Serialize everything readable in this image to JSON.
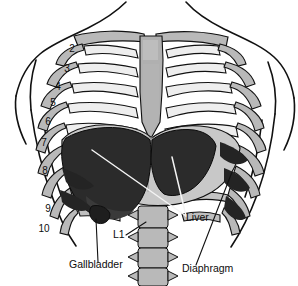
{
  "figure": {
    "background_color": "#ffffff",
    "outline_color": "#111111",
    "bone_fill": "#b9b9b9",
    "bone_highlight": "#f2f2f2",
    "organ_dark": "#2b2b2b",
    "muscle_fill": "#c8c8c8",
    "leader_light": "#f4f4f4",
    "leader_dark": "#111111"
  },
  "rib_numbers": [
    {
      "label": "2",
      "x": 72,
      "y": 52
    },
    {
      "label": "3",
      "x": 67,
      "y": 72
    },
    {
      "label": "4",
      "x": 58,
      "y": 90
    },
    {
      "label": "5",
      "x": 53,
      "y": 106
    },
    {
      "label": "6",
      "x": 48,
      "y": 125
    },
    {
      "label": "7",
      "x": 44,
      "y": 146
    },
    {
      "label": "8",
      "x": 45,
      "y": 174
    },
    {
      "label": "9",
      "x": 48,
      "y": 212
    },
    {
      "label": "10",
      "x": 44,
      "y": 232
    }
  ],
  "labels": [
    {
      "name": "liver",
      "text": "Liver",
      "x": 186,
      "y": 221
    },
    {
      "name": "l1",
      "text": "L1",
      "x": 113,
      "y": 238
    },
    {
      "name": "gallbladder",
      "text": "Gallbladder",
      "x": 69,
      "y": 268
    },
    {
      "name": "diaphragm",
      "text": "Diaphragm",
      "x": 182,
      "y": 272
    }
  ],
  "structures": [
    {
      "name": "rib-cage",
      "description": "Ribs 2 through 10 with costal cartilages"
    },
    {
      "name": "sternum",
      "description": "Central vertical breastbone"
    },
    {
      "name": "clavicle",
      "description": "Collarbone across top of thorax"
    },
    {
      "name": "liver",
      "description": "Large dark organ under right hemidiaphragm"
    },
    {
      "name": "diaphragm",
      "description": "Dome shaped muscle with radiating fibers"
    },
    {
      "name": "gallbladder",
      "description": "Small sac at inferior liver border"
    },
    {
      "name": "lumbar-spine",
      "description": "L1 and lower lumbar vertebral bodies"
    },
    {
      "name": "body-outline",
      "description": "Torso, shoulders and upper arms contour"
    }
  ]
}
